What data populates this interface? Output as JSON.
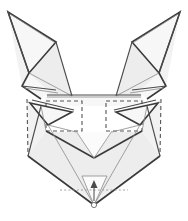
{
  "figure": {
    "canvas": {
      "width": 188,
      "height": 221,
      "background": "#ffffff"
    },
    "style": {
      "paper_fill": "#f2f2f2",
      "paper_fill_light": "#f7f7f7",
      "paper_fill_mid": "#ededed",
      "edge_heavy_color": "#3a3a3a",
      "edge_solid_color": "#4a4a4a",
      "crease_thin_color": "#8a8a8a",
      "valley_dash_color": "#555555",
      "hidden_dot_color": "#9a9a9a",
      "arrow_color": "#4a4a4a"
    },
    "parts": {
      "left_ear": "left-ear",
      "right_ear": "right-ear",
      "left_eye_guide": "left-eye-guide-square",
      "right_eye_guide": "right-eye-guide-square",
      "muzzle": "muzzle",
      "chin_point": "chin-point",
      "fold_arrow": "fold-up-arrow"
    }
  },
  "geometry": {
    "left_ear_outer": "8,12 55,40 36,73 26,97",
    "left_ear_inner": "8,12 57,44 30,72",
    "right_ear_outer": "180,12 133,40 152,73 162,97",
    "right_ear_inner": "180,12 131,44 158,72",
    "head_top_band": "47,96 141,96 146,104 42,104",
    "left_eye_square": "46,101 82,101 82,131 46,131",
    "right_eye_square": "106,101 142,101 142,131 106,131",
    "muzzle_v": "76,131 94,156 112,131",
    "chin": "94,205",
    "outline": "26,97 42,104 46,131 76,131 94,156 112,131 142,131 146,104 162,97 160,155 94,205 28,155"
  },
  "labels": {
    "arrow_direction": "up",
    "arrow_meaning": "fold-up"
  }
}
